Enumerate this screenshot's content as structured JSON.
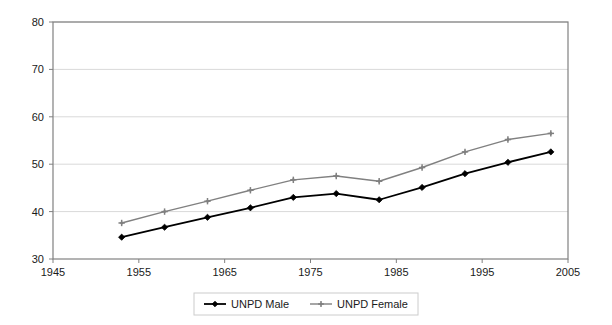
{
  "chart_data": {
    "type": "line",
    "title": "",
    "subtitle": "",
    "xlabel": "",
    "ylabel": "",
    "xlim": [
      1945,
      2005
    ],
    "ylim": [
      30,
      80
    ],
    "x_ticks": [
      1945,
      1955,
      1965,
      1975,
      1985,
      1995,
      2005
    ],
    "y_ticks": [
      30,
      40,
      50,
      60,
      70,
      80
    ],
    "grid": "horizontal",
    "legend_position": "bottom-center",
    "x": [
      1953,
      1958,
      1963,
      1968,
      1973,
      1978,
      1983,
      1988,
      1993,
      1998,
      2003
    ],
    "series": [
      {
        "name": "UNPD Male",
        "color": "#000000",
        "marker": "diamond",
        "values": [
          34.6,
          36.7,
          38.8,
          40.8,
          43.0,
          43.8,
          42.5,
          45.1,
          48.0,
          50.4,
          52.6
        ]
      },
      {
        "name": "UNPD Female",
        "color": "#808080",
        "marker": "cross",
        "values": [
          37.6,
          40.0,
          42.2,
          44.5,
          46.7,
          47.5,
          46.4,
          49.3,
          52.6,
          55.2,
          56.5
        ]
      }
    ]
  },
  "axes": {
    "y_tick_labels": [
      "80",
      "70",
      "60",
      "50",
      "40",
      "30"
    ],
    "x_tick_labels": [
      "1945",
      "1955",
      "1965",
      "1975",
      "1985",
      "1995",
      "2005"
    ]
  },
  "legend": {
    "items": [
      {
        "label": "UNPD Male"
      },
      {
        "label": "UNPD Female"
      }
    ]
  },
  "colors": {
    "male_series": "#000000",
    "female_series": "#808080",
    "plot_border": "#808080",
    "gridline": "#d9d9d9",
    "background": "#ffffff",
    "text": "#1a1a1a"
  }
}
